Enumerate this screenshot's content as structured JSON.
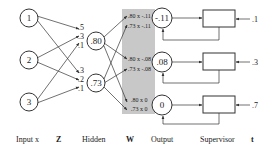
{
  "diagram": {
    "colors": {
      "line": "#333333",
      "shade": "#c8c8c8",
      "background": "#ffffff"
    },
    "inputs": [
      {
        "label": "1"
      },
      {
        "label": "2"
      },
      {
        "label": "3"
      }
    ],
    "z_weights": {
      "to_hidden_1": [
        ".5",
        ".3",
        ".1"
      ],
      "to_hidden_2": [
        ".3",
        ".2",
        ".1"
      ]
    },
    "hidden": [
      {
        "label": ".80"
      },
      {
        "label": ".73"
      }
    ],
    "w_products": [
      [
        ".80 x -.11",
        ".73 x -.11"
      ],
      [
        ".80 x -.08",
        ".73 x -.08"
      ],
      [
        ".80 x 0",
        ".73 x 0"
      ]
    ],
    "outputs": [
      {
        "label": "-.11"
      },
      {
        "label": ".08"
      },
      {
        "label": "0"
      }
    ],
    "supervisor_targets": [
      {
        "label": ".1"
      },
      {
        "label": ".3"
      },
      {
        "label": ".7"
      }
    ],
    "column_labels": {
      "input": "Input x",
      "z": "Z",
      "hidden": "Hidden",
      "w": "W",
      "output": "Output",
      "supervisor": "Supervisor",
      "t": "t"
    }
  }
}
